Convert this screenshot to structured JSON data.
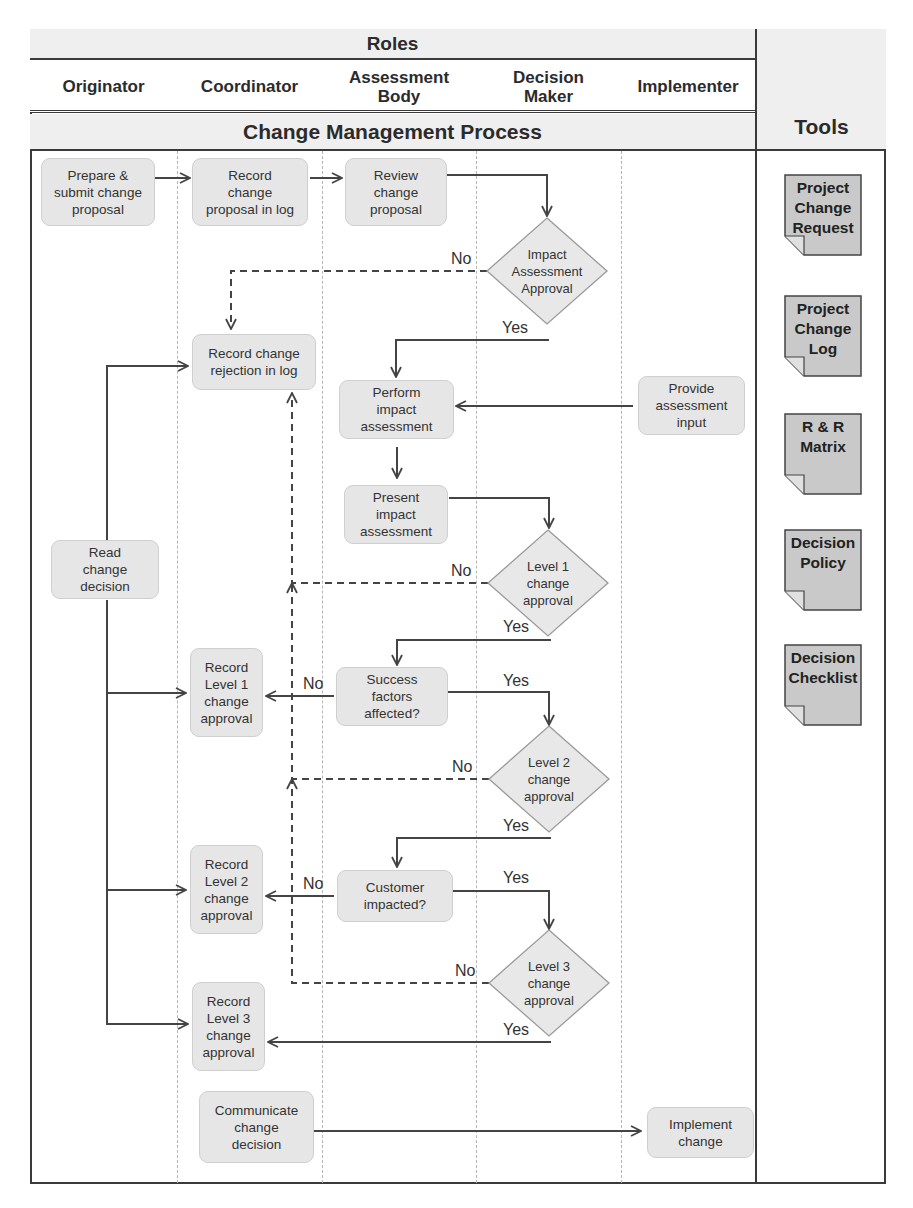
{
  "header": {
    "roles_title": "Roles",
    "process_title": "Change Management Process",
    "tools_title": "Tools"
  },
  "roles": [
    {
      "id": "originator",
      "label": "Originator",
      "x": 30,
      "w": 147
    },
    {
      "id": "coordinator",
      "label": "Coordinator",
      "x": 177,
      "w": 145
    },
    {
      "id": "assessment-body",
      "label": "Assessment\nBody",
      "x": 322,
      "w": 154
    },
    {
      "id": "decision-maker",
      "label": "Decision\nMaker",
      "x": 476,
      "w": 145
    },
    {
      "id": "implementer",
      "label": "Implementer",
      "x": 621,
      "w": 134
    }
  ],
  "lane_dividers": [
    177,
    322,
    476,
    621
  ],
  "nodes": [
    {
      "id": "prepare-submit",
      "label": "Prepare &\nsubmit change\nproposal",
      "lane": "Originator",
      "x": 41,
      "y": 158,
      "w": 114,
      "h": 68
    },
    {
      "id": "record-proposal",
      "label": "Record\nchange\nproposal in log",
      "lane": "Coordinator",
      "x": 192,
      "y": 158,
      "w": 116,
      "h": 68
    },
    {
      "id": "review-proposal",
      "label": "Review\nchange\nproposal",
      "lane": "Assessment Body",
      "x": 345,
      "y": 158,
      "w": 102,
      "h": 68
    },
    {
      "id": "record-rejection",
      "label": "Record change\nrejection in log",
      "lane": "Coordinator",
      "x": 192,
      "y": 334,
      "w": 124,
      "h": 56
    },
    {
      "id": "perform-impact",
      "label": "Perform\nimpact\nassessment",
      "lane": "Assessment Body",
      "x": 339,
      "y": 380,
      "w": 115,
      "h": 59
    },
    {
      "id": "provide-input",
      "label": "Provide\nassessment\ninput",
      "lane": "Implementer",
      "x": 638,
      "y": 376,
      "w": 107,
      "h": 59
    },
    {
      "id": "present-impact",
      "label": "Present\nimpact\nassessment",
      "lane": "Assessment Body",
      "x": 344,
      "y": 485,
      "w": 104,
      "h": 59
    },
    {
      "id": "read-decision",
      "label": "Read\nchange\ndecision",
      "lane": "Originator",
      "x": 51,
      "y": 540,
      "w": 108,
      "h": 59
    },
    {
      "id": "record-level1",
      "label": "Record\nLevel 1\nchange\napproval",
      "lane": "Coordinator",
      "x": 190,
      "y": 648,
      "w": 73,
      "h": 89
    },
    {
      "id": "success-factors",
      "label": "Success\nfactors\naffected?",
      "lane": "Assessment Body",
      "x": 336,
      "y": 667,
      "w": 112,
      "h": 59
    },
    {
      "id": "record-level2",
      "label": "Record\nLevel 2\nchange\napproval",
      "lane": "Coordinator",
      "x": 190,
      "y": 845,
      "w": 73,
      "h": 89
    },
    {
      "id": "customer-impacted",
      "label": "Customer\nimpacted?",
      "lane": "Assessment Body",
      "x": 337,
      "y": 870,
      "w": 116,
      "h": 52
    },
    {
      "id": "record-level3",
      "label": "Record\nLevel 3\nchange\napproval",
      "lane": "Coordinator",
      "x": 192,
      "y": 982,
      "w": 73,
      "h": 89
    },
    {
      "id": "communicate-decision",
      "label": "Communicate\nchange\ndecision",
      "lane": "Coordinator",
      "x": 199,
      "y": 1091,
      "w": 115,
      "h": 72
    },
    {
      "id": "implement-change",
      "label": "Implement\nchange",
      "lane": "Implementer",
      "x": 647,
      "y": 1107,
      "w": 107,
      "h": 51
    }
  ],
  "decisions": [
    {
      "id": "impact-assessment-approval",
      "label": "Impact\nAssessment\nApproval",
      "lane": "Decision Maker",
      "cx": 547,
      "cy": 271,
      "hw": 60,
      "hh": 53
    },
    {
      "id": "level1-change-approval",
      "label": "Level 1\nchange\napproval",
      "lane": "Decision Maker",
      "cx": 548,
      "cy": 583,
      "hw": 60,
      "hh": 53
    },
    {
      "id": "level2-change-approval",
      "label": "Level 2\nchange\napproval",
      "lane": "Decision Maker",
      "cx": 549,
      "cy": 779,
      "hw": 60,
      "hh": 53
    },
    {
      "id": "level3-change-approval",
      "label": "Level 3\nchange\napproval",
      "lane": "Decision Maker",
      "cx": 549,
      "cy": 983,
      "hw": 60,
      "hh": 53
    }
  ],
  "edge_labels": [
    {
      "id": "no-impact",
      "text": "No",
      "x": 451,
      "y": 251
    },
    {
      "id": "yes-impact",
      "text": "Yes",
      "x": 502,
      "y": 320
    },
    {
      "id": "no-level1",
      "text": "No",
      "x": 451,
      "y": 563
    },
    {
      "id": "yes-level1",
      "text": "Yes",
      "x": 503,
      "y": 619
    },
    {
      "id": "no-success",
      "text": "No",
      "x": 303,
      "y": 676
    },
    {
      "id": "yes-success",
      "text": "Yes",
      "x": 503,
      "y": 673
    },
    {
      "id": "no-level2",
      "text": "No",
      "x": 452,
      "y": 759
    },
    {
      "id": "yes-level2",
      "text": "Yes",
      "x": 503,
      "y": 818
    },
    {
      "id": "no-customer",
      "text": "No",
      "x": 303,
      "y": 876
    },
    {
      "id": "yes-customer",
      "text": "Yes",
      "x": 503,
      "y": 870
    },
    {
      "id": "no-level3",
      "text": "No",
      "x": 455,
      "y": 963
    },
    {
      "id": "yes-level3",
      "text": "Yes",
      "x": 503,
      "y": 1022
    }
  ],
  "edges": [
    {
      "from": "prepare-submit",
      "to": "record-proposal",
      "style": "solid",
      "points": [
        [
          155,
          178
        ],
        [
          190,
          178
        ]
      ]
    },
    {
      "from": "record-proposal",
      "to": "review-proposal",
      "style": "solid",
      "points": [
        [
          310,
          178
        ],
        [
          342,
          178
        ]
      ]
    },
    {
      "from": "review-proposal",
      "to": "impact-assessment-approval",
      "style": "solid",
      "points": [
        [
          447,
          175
        ],
        [
          547,
          175
        ],
        [
          547,
          216
        ]
      ]
    },
    {
      "from": "impact-assessment-approval",
      "to": "record-rejection",
      "label": "No",
      "style": "dashed",
      "points": [
        [
          487,
          271
        ],
        [
          231,
          271
        ],
        [
          231,
          329
        ]
      ]
    },
    {
      "from": "impact-assessment-approval",
      "to": "perform-impact",
      "label": "Yes",
      "style": "solid",
      "points": [
        [
          549,
          340
        ],
        [
          396,
          340
        ],
        [
          396,
          377
        ]
      ]
    },
    {
      "from": "provide-input",
      "to": "perform-impact",
      "style": "solid",
      "points": [
        [
          633,
          406
        ],
        [
          456,
          406
        ]
      ]
    },
    {
      "from": "perform-impact",
      "to": "present-impact",
      "style": "solid",
      "points": [
        [
          397,
          447
        ],
        [
          397,
          478
        ]
      ]
    },
    {
      "from": "present-impact",
      "to": "level1-change-approval",
      "style": "solid",
      "points": [
        [
          449,
          498
        ],
        [
          549,
          498
        ],
        [
          549,
          528
        ]
      ]
    },
    {
      "from": "level1-change-approval",
      "to": "record-rejection",
      "label": "No",
      "style": "dashed",
      "points": [
        [
          488,
          583
        ],
        [
          292,
          583
        ],
        [
          292,
          393
        ]
      ]
    },
    {
      "from": "level1-change-approval",
      "to": "success-factors",
      "label": "Yes",
      "style": "solid",
      "points": [
        [
          551,
          640
        ],
        [
          397,
          640
        ],
        [
          397,
          665
        ]
      ]
    },
    {
      "from": "success-factors",
      "to": "record-level1",
      "label": "No",
      "style": "solid",
      "points": [
        [
          334,
          696
        ],
        [
          266,
          696
        ]
      ]
    },
    {
      "from": "success-factors",
      "to": "level2-change-approval",
      "label": "Yes",
      "style": "solid",
      "points": [
        [
          448,
          692
        ],
        [
          549,
          692
        ],
        [
          549,
          725
        ]
      ]
    },
    {
      "from": "level2-change-approval",
      "to": "record-rejection",
      "label": "No",
      "style": "dashed",
      "points": [
        [
          489,
          779
        ],
        [
          292,
          779
        ],
        [
          292,
          583
        ]
      ]
    },
    {
      "from": "level2-change-approval",
      "to": "customer-impacted",
      "label": "Yes",
      "style": "solid",
      "points": [
        [
          551,
          838
        ],
        [
          397,
          838
        ],
        [
          397,
          867
        ]
      ]
    },
    {
      "from": "customer-impacted",
      "to": "record-level2",
      "label": "No",
      "style": "solid",
      "points": [
        [
          334,
          896
        ],
        [
          266,
          896
        ]
      ]
    },
    {
      "from": "customer-impacted",
      "to": "level3-change-approval",
      "label": "Yes",
      "style": "solid",
      "points": [
        [
          453,
          891
        ],
        [
          549,
          891
        ],
        [
          549,
          929
        ]
      ]
    },
    {
      "from": "level3-change-approval",
      "to": "record-level2",
      "label": "No",
      "style": "dashed",
      "points": [
        [
          489,
          983
        ],
        [
          292,
          983
        ],
        [
          292,
          779
        ]
      ]
    },
    {
      "from": "level3-change-approval",
      "to": "record-level3",
      "label": "Yes",
      "style": "solid",
      "points": [
        [
          551,
          1042
        ],
        [
          268,
          1042
        ]
      ]
    },
    {
      "from": "communicate-decision",
      "to": "implement-change",
      "style": "solid",
      "points": [
        [
          314,
          1131
        ],
        [
          641,
          1131
        ]
      ]
    },
    {
      "from": "read-decision",
      "to": "record-rejection",
      "style": "solid",
      "points": [
        [
          107,
          540
        ],
        [
          107,
          366
        ],
        [
          188,
          366
        ]
      ]
    },
    {
      "from": "read-decision",
      "to": "record-level1",
      "style": "solid",
      "points": [
        [
          107,
          600
        ],
        [
          107,
          693
        ],
        [
          186,
          693
        ]
      ]
    },
    {
      "from": "read-decision",
      "to": "record-level2",
      "style": "solid",
      "points": [
        [
          107,
          693
        ],
        [
          107,
          890
        ],
        [
          186,
          890
        ]
      ]
    },
    {
      "from": "read-decision",
      "to": "record-level3",
      "style": "solid",
      "points": [
        [
          107,
          890
        ],
        [
          107,
          1024
        ],
        [
          188,
          1024
        ]
      ]
    }
  ],
  "tools": [
    {
      "id": "project-change-request",
      "label": "Project\nChange\nRequest",
      "x": 784,
      "y": 174
    },
    {
      "id": "project-change-log",
      "label": "Project\nChange\nLog",
      "x": 784,
      "y": 295
    },
    {
      "id": "rr-matrix",
      "label": "R & R\nMatrix",
      "x": 784,
      "y": 413
    },
    {
      "id": "decision-policy",
      "label": "Decision\nPolicy",
      "x": 784,
      "y": 529
    },
    {
      "id": "decision-checklist",
      "label": "Decision\nChecklist",
      "x": 784,
      "y": 644
    }
  ],
  "colors": {
    "node_fill": "#e6e6e6",
    "tool_fill": "#c9c9c9",
    "line": "#444444",
    "border": "#3a3a3a",
    "header_fill": "#efefef"
  }
}
